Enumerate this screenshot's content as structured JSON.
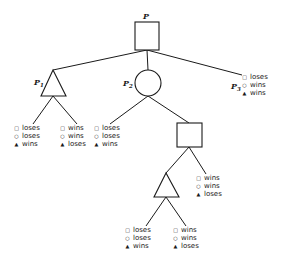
{
  "diagram": {
    "type": "game-tree",
    "colors": {
      "ink": "#1a1a1a",
      "background": "#ffffff"
    },
    "player_symbols": {
      "square": "□",
      "circle": "○",
      "triangle": "▲"
    },
    "nodes": {
      "root": {
        "shape": "square",
        "label": "P",
        "sub": ""
      },
      "p1": {
        "shape": "triangle",
        "label": "P",
        "sub": "1"
      },
      "p2": {
        "shape": "circle",
        "label": "P",
        "sub": "2"
      },
      "p3": {
        "shape": "leaf",
        "label": "P",
        "sub": "3"
      },
      "inner_square": {
        "shape": "square",
        "label": "",
        "sub": ""
      },
      "inner_triangle": {
        "shape": "triangle",
        "label": "",
        "sub": ""
      }
    },
    "leaves": [
      {
        "id": "p1-left",
        "rows": [
          {
            "sym": "□",
            "text": "loses"
          },
          {
            "sym": "○",
            "text": "loses"
          },
          {
            "sym": "▲",
            "text": "wins"
          }
        ]
      },
      {
        "id": "p1-right",
        "rows": [
          {
            "sym": "□",
            "text": "wins"
          },
          {
            "sym": "○",
            "text": "wins"
          },
          {
            "sym": "▲",
            "text": "loses"
          }
        ]
      },
      {
        "id": "p2-left",
        "rows": [
          {
            "sym": "□",
            "text": "loses"
          },
          {
            "sym": "○",
            "text": "loses"
          },
          {
            "sym": "▲",
            "text": "wins"
          }
        ]
      },
      {
        "id": "p3",
        "rows": [
          {
            "sym": "□",
            "text": "loses"
          },
          {
            "sym": "○",
            "text": "wins"
          },
          {
            "sym": "▲",
            "text": "wins"
          }
        ]
      },
      {
        "id": "inner-square-right",
        "rows": [
          {
            "sym": "□",
            "text": "wins"
          },
          {
            "sym": "○",
            "text": "wins"
          },
          {
            "sym": "▲",
            "text": "loses"
          }
        ]
      },
      {
        "id": "inner-triangle-left",
        "rows": [
          {
            "sym": "□",
            "text": "loses"
          },
          {
            "sym": "○",
            "text": "loses"
          },
          {
            "sym": "▲",
            "text": "wins"
          }
        ]
      },
      {
        "id": "inner-triangle-right",
        "rows": [
          {
            "sym": "□",
            "text": "wins"
          },
          {
            "sym": "○",
            "text": "wins"
          },
          {
            "sym": "▲",
            "text": "loses"
          }
        ]
      }
    ]
  }
}
